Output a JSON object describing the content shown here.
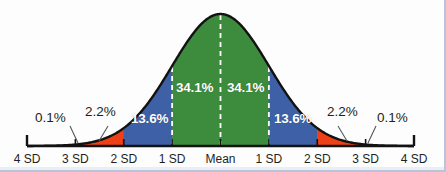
{
  "figure": {
    "background_color": "#fdfdfd",
    "frame_color": "#b9c4da"
  },
  "chart_data": {
    "type": "area",
    "title": "",
    "subtitle": "",
    "xlabel": "",
    "ylabel": "",
    "grid": false,
    "legend_position": "none",
    "x": [
      -4,
      -3,
      -2,
      -1,
      0,
      1,
      2,
      3,
      4
    ],
    "xtick_labels": [
      "4 SD",
      "3 SD",
      "2 SD",
      "1 SD",
      "Mean",
      "1 SD",
      "2 SD",
      "3 SD",
      "4 SD"
    ],
    "xlim": [
      -4,
      4
    ],
    "ylim": [
      0,
      1
    ],
    "curve": "standard normal probability density",
    "bands": [
      {
        "name": "minus-4sd-to-minus-3sd",
        "from": -4,
        "to": -3,
        "percent": "0.1%",
        "color": "#ffffff",
        "label_placement": "outside-left"
      },
      {
        "name": "minus-3sd-to-minus-2sd",
        "from": -3,
        "to": -2,
        "percent": "2.2%",
        "color": "#ee3f17",
        "label_placement": "outside-left"
      },
      {
        "name": "minus-2sd-to-minus-1sd",
        "from": -2,
        "to": -1,
        "percent": "13.6%",
        "color": "#3e60a6",
        "label_placement": "inside"
      },
      {
        "name": "minus-1sd-to-mean",
        "from": -1,
        "to": 0,
        "percent": "34.1%",
        "color": "#3d8b3d",
        "label_placement": "inside"
      },
      {
        "name": "mean-to-plus-1sd",
        "from": 0,
        "to": 1,
        "percent": "34.1%",
        "color": "#3d8b3d",
        "label_placement": "inside"
      },
      {
        "name": "plus-1sd-to-plus-2sd",
        "from": 1,
        "to": 2,
        "percent": "13.6%",
        "color": "#3e60a6",
        "label_placement": "inside"
      },
      {
        "name": "plus-2sd-to-plus-3sd",
        "from": 2,
        "to": 3,
        "percent": "2.2%",
        "color": "#ee3f17",
        "label_placement": "outside-right"
      },
      {
        "name": "plus-3sd-to-plus-4sd",
        "from": 3,
        "to": 4,
        "percent": "0.1%",
        "color": "#ffffff",
        "label_placement": "outside-right"
      }
    ],
    "colors": {
      "green": "#3d8b3d",
      "blue": "#3e60a6",
      "red": "#ee3f17",
      "curve_outline": "#121212",
      "axis": "#121212",
      "dashed_divider": "#ffffff",
      "inside_label_text": "#ffffff",
      "outside_label_text": "#231f20"
    },
    "annotations": {
      "left_01": "0.1%",
      "left_22": "2.2%",
      "left_136": "13.6%",
      "left_341": "34.1%",
      "right_341": "34.1%",
      "right_136": "13.6%",
      "right_22": "2.2%",
      "right_01": "0.1%"
    },
    "axis_ticks": [
      {
        "label": "4 SD",
        "value": -4
      },
      {
        "label": "3 SD",
        "value": -3
      },
      {
        "label": "2 SD",
        "value": -2
      },
      {
        "label": "1 SD",
        "value": -1
      },
      {
        "label": "Mean",
        "value": 0
      },
      {
        "label": "1 SD",
        "value": 1
      },
      {
        "label": "2 SD",
        "value": 2
      },
      {
        "label": "3 SD",
        "value": 3
      },
      {
        "label": "4 SD",
        "value": 4
      }
    ]
  }
}
